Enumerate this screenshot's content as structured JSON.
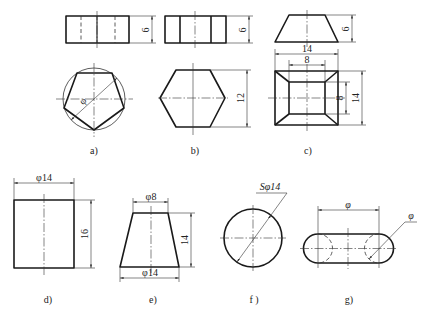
{
  "figure": {
    "panels": [
      {
        "id": "a",
        "label": "a)",
        "views": [
          "front rectangle with hidden lines",
          "top pentagon inscribed in circle"
        ],
        "dims": {
          "height": "6",
          "circle_diameter": "φ"
        }
      },
      {
        "id": "b",
        "label": "b)",
        "views": [
          "front rectangle with two visible edges",
          "top hexagon"
        ],
        "dims": {
          "height": "6",
          "across_flats": "12"
        }
      },
      {
        "id": "c",
        "label": "c)",
        "views": [
          "front trapezoid",
          "top square frustum"
        ],
        "dims": {
          "height": "6",
          "outer_width": "14",
          "inner_width": "8",
          "inner_height": "8",
          "outer_height": "14"
        }
      },
      {
        "id": "d",
        "label": "d)",
        "views": [
          "cylinder front"
        ],
        "dims": {
          "diameter": "φ14",
          "height": "16"
        }
      },
      {
        "id": "e",
        "label": "e)",
        "views": [
          "cone frustum front"
        ],
        "dims": {
          "top_diameter": "φ8",
          "bottom_diameter": "φ14",
          "height": "14"
        }
      },
      {
        "id": "f",
        "label": "f )",
        "views": [
          "sphere"
        ],
        "dims": {
          "diameter": "Sφ14"
        }
      },
      {
        "id": "g",
        "label": "g)",
        "views": [
          "slot / obround"
        ],
        "dims": {
          "center_distance": "φ",
          "end_diameter": "φ"
        }
      }
    ]
  },
  "text": {
    "a_h": "6",
    "a_phi": "φ",
    "a_label": "a)",
    "b_h": "6",
    "b_w": "12",
    "b_label": "b)",
    "c_h": "6",
    "c_14": "14",
    "c_8": "8",
    "c_8v": "8",
    "c_14v": "14",
    "c_label": "c)",
    "d_phi": "φ14",
    "d_h": "16",
    "d_label": "d)",
    "e_top": "φ8",
    "e_bot": "φ14",
    "e_h": "14",
    "e_label": "e)",
    "f_s": "Sφ14",
    "f_label": "f )",
    "g_phi1": "φ",
    "g_phi2": "φ",
    "g_label": "g)"
  }
}
